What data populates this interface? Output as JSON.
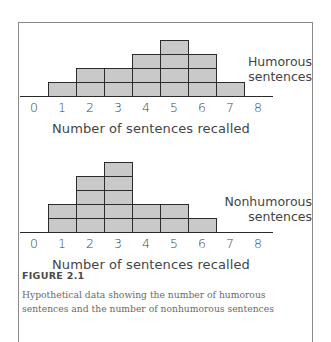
{
  "chart_data": [
    {
      "type": "bar",
      "title": "Humorous sentences",
      "categories": [
        "0",
        "1",
        "2",
        "3",
        "4",
        "5",
        "6",
        "7",
        "8"
      ],
      "values": [
        0,
        1,
        2,
        2,
        3,
        4,
        3,
        1,
        0
      ],
      "xlabel": "Number of sentences recalled",
      "ylabel": "",
      "ylim": [
        0,
        4
      ],
      "grid": false,
      "style": "stacked-unit-histogram"
    },
    {
      "type": "bar",
      "title": "Nonhumorous sentences",
      "categories": [
        "0",
        "1",
        "2",
        "3",
        "4",
        "5",
        "6",
        "7",
        "8"
      ],
      "values": [
        0,
        2,
        4,
        5,
        2,
        2,
        1,
        0,
        0
      ],
      "xlabel": "Number of sentences recalled",
      "ylabel": "",
      "ylim": [
        0,
        5
      ],
      "grid": false,
      "style": "stacked-unit-histogram"
    }
  ],
  "charts": [
    {
      "series_label_line1": "Humorous",
      "series_label_line2": "sentences",
      "xlabel": "Number of sentences recalled",
      "ticks": [
        "0",
        "1",
        "2",
        "3",
        "4",
        "5",
        "6",
        "7",
        "8"
      ]
    },
    {
      "series_label_line1": "Nonhumorous",
      "series_label_line2": "sentences",
      "xlabel": "Number of sentences recalled",
      "ticks": [
        "0",
        "1",
        "2",
        "3",
        "4",
        "5",
        "6",
        "7",
        "8"
      ]
    }
  ],
  "figure": {
    "title": "FIGURE 2.1",
    "caption": "Hypothetical data showing the number of humorous sentences and the number of nonhumorous sentences"
  },
  "colors": {
    "bar_fill": "#c9c9c9",
    "bar_border": "#2b2b2b",
    "frame": "#8a8a8a",
    "text": "#444444"
  }
}
